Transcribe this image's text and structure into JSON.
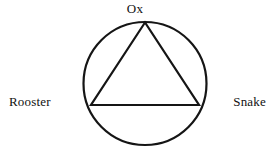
{
  "diagram": {
    "type": "trine-triangle-in-circle",
    "stroke_color": "#151515",
    "background_color": "#ffffff",
    "stroke_width": 2.2,
    "circle": {
      "cx": 145,
      "cy": 83.5,
      "r": 61.5
    },
    "triangle": {
      "points": "145,22.5 91,105 199,105"
    },
    "nodes": [
      {
        "id": "ox",
        "label": "Ox",
        "position": "top"
      },
      {
        "id": "rooster",
        "label": "Rooster",
        "position": "left"
      },
      {
        "id": "snake",
        "label": "Snake",
        "position": "right"
      }
    ]
  }
}
